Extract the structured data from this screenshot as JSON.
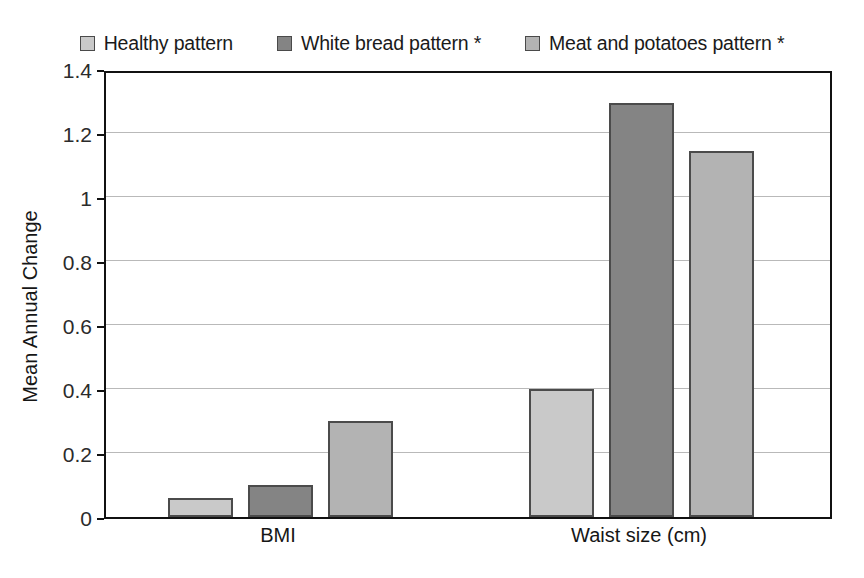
{
  "chart_data": {
    "type": "bar",
    "title": "",
    "xlabel": "",
    "ylabel": "Mean Annual Change",
    "categories": [
      "BMI",
      "Waist size (cm)"
    ],
    "series": [
      {
        "name": "Healthy pattern",
        "values": [
          0.06,
          0.4
        ],
        "color": "#c9c9c9"
      },
      {
        "name": "White bread pattern *",
        "values": [
          0.1,
          1.295
        ],
        "color": "#848484"
      },
      {
        "name": "Meat and potatoes pattern *",
        "values": [
          0.3,
          1.145
        ],
        "color": "#b3b3b3"
      }
    ],
    "ylim": [
      0,
      1.4
    ],
    "ytick_labels": [
      "0",
      "0.2",
      "0.4",
      "0.6",
      "0.8",
      "1",
      "1.2",
      "1.4"
    ],
    "ytick_values": [
      0,
      0.2,
      0.4,
      0.6,
      0.8,
      1.0,
      1.2,
      1.4
    ],
    "grid": true,
    "legend_position": "top",
    "bar_border_color": "#4b4b4b",
    "gridline_color": "#b9b9b9",
    "axis_color": "#111111"
  },
  "legend": {
    "entries": [
      {
        "label": "Healthy pattern",
        "color": "#c9c9c9"
      },
      {
        "label": "White bread pattern *",
        "color": "#848484"
      },
      {
        "label": "Meat and potatoes pattern *",
        "color": "#b3b3b3"
      }
    ]
  },
  "axes": {
    "y_title": "Mean Annual Change",
    "y_ticks": [
      "0",
      "0.2",
      "0.4",
      "0.6",
      "0.8",
      "1",
      "1.2",
      "1.4"
    ],
    "x_ticks": [
      "BMI",
      "Waist size (cm)"
    ]
  }
}
